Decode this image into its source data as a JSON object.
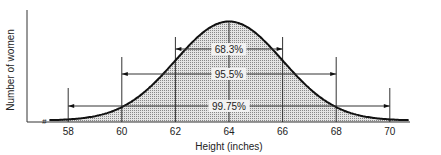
{
  "chart_data": {
    "type": "area",
    "title": "",
    "xlabel": "Height (inches)",
    "ylabel": "Number of women",
    "x_ticks": [
      58,
      60,
      62,
      64,
      66,
      68,
      70
    ],
    "xlim": [
      56.5,
      71.5
    ],
    "distribution": {
      "kind": "normal",
      "mean": 64,
      "sd": 2
    },
    "grid": false,
    "axis_break": true,
    "intervals": [
      {
        "label": "68.3%",
        "from": 62,
        "to": 66,
        "sd": 1
      },
      {
        "label": "95.5%",
        "from": 60,
        "to": 68,
        "sd": 2
      },
      {
        "label": "99.75%",
        "from": 58,
        "to": 70,
        "sd": 3
      }
    ],
    "vertical_lines": [
      58,
      60,
      62,
      64,
      66,
      68,
      70
    ]
  }
}
